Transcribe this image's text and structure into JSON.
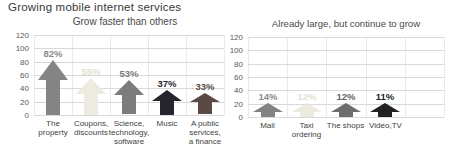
{
  "header": {
    "title": "Growing mobile internet services"
  },
  "colors": {
    "background": "#ffffff",
    "grid_horizontal": "#d9d9d9",
    "grid_vertical": "#eaeaea",
    "axis_text": "#595959",
    "category_text": "#3f3f3f",
    "title_text": "#383838",
    "subtitle_text": "#4a4a4a"
  },
  "chart_data": [
    {
      "type": "bar",
      "title": "Grow faster than others",
      "xlabel": "",
      "ylabel": "",
      "ylim": [
        0,
        120
      ],
      "yticks": [
        0,
        20,
        40,
        60,
        80,
        100,
        120
      ],
      "grid": true,
      "legend": "none",
      "columns": 5,
      "categories": [
        "The property",
        "Coupons, discounts",
        "Science, technology, software",
        "Music",
        "A public services, a finance"
      ],
      "category_lines": [
        [
          "The property"
        ],
        [
          "Coupons,",
          "discounts"
        ],
        [
          "Science,",
          "technology,",
          "software"
        ],
        [
          "Music"
        ],
        [
          "A public",
          "services,",
          "a finance"
        ]
      ],
      "values": [
        82,
        55,
        53,
        37,
        33
      ],
      "value_labels": [
        "82%",
        "55%",
        "53%",
        "37%",
        "33%"
      ],
      "bar_colors": [
        "#848484",
        "#edebdf",
        "#7c7c7c",
        "#26242e",
        "#5a4a43"
      ],
      "label_colors": [
        "#8a8a8a",
        "#e5e1d0",
        "#7c7c7c",
        "#2a2a32",
        "#5a4a43"
      ]
    },
    {
      "type": "bar",
      "title": "Already large, but continue to grow",
      "xlabel": "",
      "ylabel": "",
      "ylim": [
        0,
        120
      ],
      "yticks": [
        0,
        20,
        40,
        60,
        80,
        100,
        120
      ],
      "grid": true,
      "legend": "none",
      "columns": 5,
      "categories": [
        "Mail",
        "Taxi ordering",
        "The shops",
        "Video,TV"
      ],
      "category_lines": [
        [
          "Mail"
        ],
        [
          "Taxi",
          "ordering"
        ],
        [
          "The shops"
        ],
        [
          "Video,TV"
        ]
      ],
      "values": [
        14,
        12,
        12,
        11
      ],
      "value_labels": [
        "14%",
        "12%",
        "12%",
        "11%"
      ],
      "bar_colors": [
        "#828282",
        "#edebdf",
        "#6d6d6d",
        "#222222"
      ],
      "label_colors": [
        "#8a8a8a",
        "#e5e1d0",
        "#636363",
        "#1f1f1f"
      ]
    }
  ]
}
